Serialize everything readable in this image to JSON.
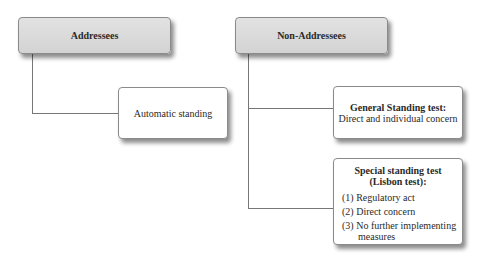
{
  "diagram": {
    "type": "hierarchy",
    "nodes": {
      "addressees": {
        "label": "Addressees"
      },
      "non_addressees": {
        "label": "Non-Addressees"
      },
      "automatic": {
        "label": "Automatic standing"
      },
      "general": {
        "title": "General Standing test:",
        "subtitle": "Direct and individual concern"
      },
      "special": {
        "title_line1": "Special standing test",
        "title_line2": "(Lisbon test):",
        "items": [
          "(1) Regulatory act",
          "(2) Direct concern",
          "(3) No further implementing",
          "measures"
        ]
      }
    },
    "edges": [
      [
        "Addressees",
        "Automatic standing"
      ],
      [
        "Non-Addressees",
        "General Standing test"
      ],
      [
        "Non-Addressees",
        "Special standing test"
      ]
    ],
    "colors": {
      "header_fill": "#d9d9d9",
      "leaf_fill": "#ffffff",
      "connector": "#777777"
    }
  }
}
